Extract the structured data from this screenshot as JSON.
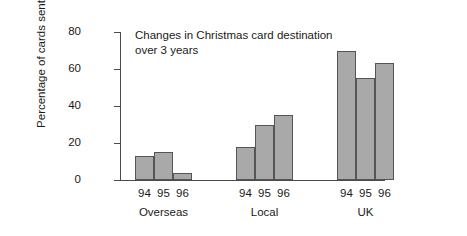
{
  "chart_data": {
    "type": "bar",
    "title": "Changes in Christmas card destination\nover 3 years",
    "xlabel": "",
    "ylabel": "Percentage of cards sent",
    "ylim": [
      0,
      80
    ],
    "yticks": [
      0,
      20,
      40,
      60,
      80
    ],
    "ytick_labels": [
      "0",
      "20",
      "40",
      "60",
      "80"
    ],
    "grid": false,
    "legend": "none",
    "categories": [
      "Overseas",
      "Local",
      "UK"
    ],
    "series": [
      {
        "name": "94",
        "values": [
          13,
          18,
          70
        ]
      },
      {
        "name": "95",
        "values": [
          15,
          30,
          55
        ]
      },
      {
        "name": "96",
        "values": [
          4,
          35,
          63
        ]
      }
    ],
    "groups": [
      {
        "label": "Overseas",
        "bars": [
          {
            "year": "94",
            "value": 13
          },
          {
            "year": "95",
            "value": 15
          },
          {
            "year": "96",
            "value": 4
          }
        ]
      },
      {
        "label": "Local",
        "bars": [
          {
            "year": "94",
            "value": 18
          },
          {
            "year": "95",
            "value": 30
          },
          {
            "year": "96",
            "value": 35
          }
        ]
      },
      {
        "label": "UK",
        "bars": [
          {
            "year": "94",
            "value": 70
          },
          {
            "year": "95",
            "value": 55
          },
          {
            "year": "96",
            "value": 63
          }
        ]
      }
    ],
    "colors": {
      "bar_fill": "#a9a9a9",
      "bar_stroke": "#555555",
      "axis": "#4a4a4a",
      "text": "#1a1a1a",
      "frame": "#3a3a3a",
      "background": "#ffffff"
    }
  }
}
